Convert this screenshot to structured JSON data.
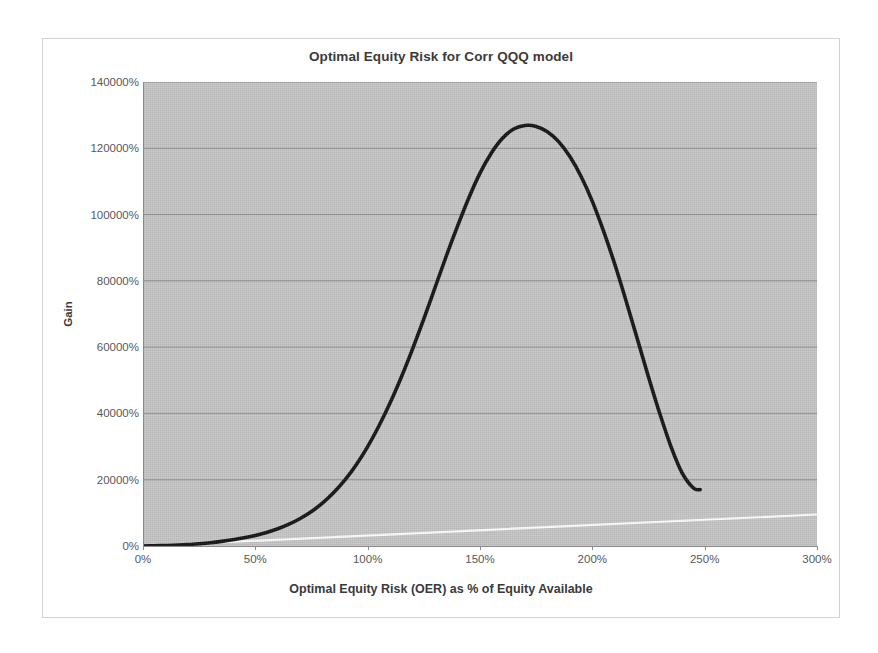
{
  "chart_data": {
    "type": "line",
    "title": "Optimal Equity Risk for Corr QQQ model",
    "xlabel": "Optimal Equity Risk (OER) as % of Equity Available",
    "ylabel": "Gain",
    "xlim": [
      0,
      300
    ],
    "ylim": [
      0,
      140000
    ],
    "xtick_labels": [
      "0%",
      "50%",
      "100%",
      "150%",
      "200%",
      "250%",
      "300%"
    ],
    "xticks": [
      0,
      50,
      100,
      150,
      200,
      250,
      300
    ],
    "ytick_labels": [
      "0%",
      "20000%",
      "40000%",
      "60000%",
      "80000%",
      "100000%",
      "120000%",
      "140000%"
    ],
    "yticks": [
      0,
      20000,
      40000,
      60000,
      80000,
      100000,
      120000,
      140000
    ],
    "grid": "horizontal",
    "legend": "none",
    "plot_background": "#c6c6c6",
    "series": [
      {
        "name": "Gain",
        "color": "#141414",
        "x": [
          0,
          5,
          10,
          15,
          20,
          25,
          30,
          35,
          40,
          45,
          50,
          55,
          60,
          65,
          70,
          75,
          80,
          85,
          90,
          95,
          100,
          105,
          110,
          115,
          120,
          125,
          130,
          135,
          140,
          145,
          150,
          155,
          160,
          165,
          170,
          175,
          180,
          185,
          190,
          195,
          200,
          205,
          210,
          215,
          220,
          225,
          230,
          235,
          240,
          245,
          248
        ],
        "values": [
          0,
          60,
          150,
          280,
          450,
          700,
          1000,
          1400,
          1900,
          2500,
          3200,
          4100,
          5200,
          6600,
          8300,
          10400,
          13000,
          16200,
          20000,
          24600,
          30000,
          36200,
          43200,
          51000,
          59500,
          68500,
          78000,
          87500,
          96500,
          105000,
          112500,
          118500,
          123000,
          125800,
          126900,
          126600,
          125000,
          122000,
          117500,
          111500,
          104000,
          95000,
          85000,
          74000,
          62500,
          51000,
          40000,
          30000,
          22000,
          17500,
          17000
        ]
      },
      {
        "name": "Reference",
        "color": "#ffffff",
        "x": [
          0,
          300
        ],
        "values": [
          0,
          9500
        ]
      }
    ],
    "annotations": {
      "peak_x_percent": 200,
      "peak_y_percent": 127000,
      "curve_end_x_percent": 248
    }
  }
}
